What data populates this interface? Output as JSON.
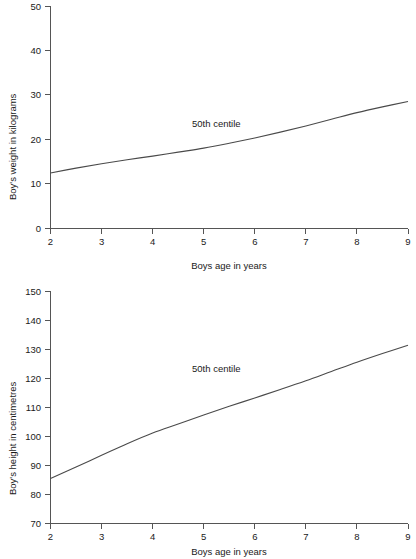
{
  "chart_data": [
    {
      "id": "boys-weight",
      "type": "line",
      "title": "",
      "xlabel": "Boys age in years",
      "ylabel": "Boy's weight in kilograms",
      "xlim": [
        2,
        9
      ],
      "ylim": [
        0,
        50
      ],
      "xticks": [
        "2",
        "3",
        "4",
        "5",
        "6",
        "7",
        "8",
        "9"
      ],
      "yticks": [
        "0",
        "10",
        "20",
        "30",
        "40",
        "50"
      ],
      "grid": false,
      "legend_position": "inline-annotation",
      "annotation": "50th centile",
      "series": [
        {
          "name": "50th centile",
          "x": [
            2,
            2.5,
            3,
            3.5,
            4,
            4.5,
            5,
            5.5,
            6,
            6.5,
            7,
            7.5,
            8,
            8.5,
            9
          ],
          "values": [
            12.5,
            13.6,
            14.6,
            15.5,
            16.3,
            17.2,
            18.1,
            19.2,
            20.4,
            21.7,
            23.1,
            24.6,
            26.1,
            27.4,
            28.6
          ]
        }
      ]
    },
    {
      "id": "boys-height",
      "type": "line",
      "title": "",
      "xlabel": "Boys age in years",
      "ylabel": "Boy's height in centimetres",
      "xlim": [
        2,
        9
      ],
      "ylim": [
        70,
        150
      ],
      "xticks": [
        "2",
        "3",
        "4",
        "5",
        "6",
        "7",
        "8",
        "9"
      ],
      "yticks": [
        "70",
        "80",
        "90",
        "100",
        "110",
        "120",
        "130",
        "140",
        "150"
      ],
      "grid": false,
      "legend_position": "inline-annotation",
      "annotation": "50th centile",
      "series": [
        {
          "name": "50th centile",
          "x": [
            2,
            2.5,
            3,
            3.5,
            4,
            4.5,
            5,
            5.5,
            6,
            6.5,
            7,
            7.5,
            8,
            8.5,
            9
          ],
          "values": [
            85.5,
            89.5,
            93.5,
            97.5,
            101.2,
            104.3,
            107.4,
            110.4,
            113.3,
            116.2,
            119.2,
            122.4,
            125.6,
            128.6,
            131.5
          ]
        }
      ]
    }
  ],
  "colors": {
    "curve": "#4a4a4a",
    "axis": "#555555",
    "text": "#1a1a1a",
    "background": "#ffffff"
  }
}
